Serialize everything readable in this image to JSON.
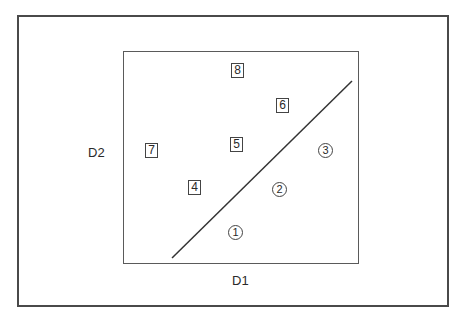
{
  "diagram": {
    "x_axis_label": "D1",
    "y_axis_label": "D2",
    "boxed_items": [
      {
        "label": "4",
        "x": 188,
        "y": 180
      },
      {
        "label": "5",
        "x": 230,
        "y": 137
      },
      {
        "label": "6",
        "x": 276,
        "y": 98
      },
      {
        "label": "7",
        "x": 145,
        "y": 143
      },
      {
        "label": "8",
        "x": 231,
        "y": 63
      }
    ],
    "circled_items": [
      {
        "label": "1",
        "x": 228,
        "y": 225
      },
      {
        "label": "2",
        "x": 272,
        "y": 182
      },
      {
        "label": "3",
        "x": 318,
        "y": 143
      }
    ],
    "divider_line": {
      "x1": 172,
      "y1": 258,
      "x2": 352,
      "y2": 81
    },
    "colors": {
      "frame": "#4a4a4a",
      "text": "#2a2a2a",
      "background": "#ffffff"
    }
  }
}
